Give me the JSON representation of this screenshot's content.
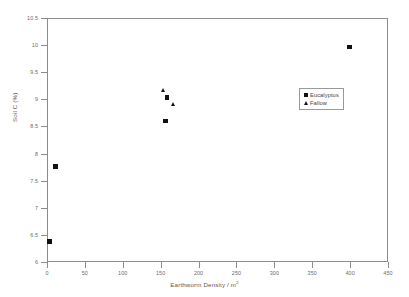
{
  "chart_data": {
    "type": "scatter",
    "title": "",
    "xlabel": "Earthworm Density / m",
    "xlabel_sup": "2",
    "ylabel": "Soil C (%)",
    "xlim": [
      0,
      450
    ],
    "ylim": [
      6,
      10.5
    ],
    "xticks": [
      0,
      50,
      100,
      150,
      200,
      250,
      300,
      350,
      400,
      450
    ],
    "xtick_labels": [
      "0",
      "50",
      "100",
      "150",
      "200",
      "250",
      "300",
      "350",
      "400",
      "450"
    ],
    "yticks": [
      6,
      6.5,
      7,
      7.5,
      8,
      8.5,
      9,
      9.5,
      10,
      10.5
    ],
    "ytick_labels": [
      "6",
      "6.5",
      "7",
      "7.5",
      "8",
      "8.5",
      "9",
      "9.5",
      "10",
      "10.5"
    ],
    "grid": false,
    "legend_position": "upper right",
    "marker_color": "#111111",
    "frame_color": "#8c8c8c",
    "series": [
      {
        "name": "Eucalyptus",
        "marker": "square",
        "points": [
          {
            "x": 2,
            "y": 6.4
          },
          {
            "x": 10,
            "y": 7.78
          },
          {
            "x": 155,
            "y": 8.62
          },
          {
            "x": 157,
            "y": 9.05
          },
          {
            "x": 398,
            "y": 9.98
          }
        ]
      },
      {
        "name": "Fallow",
        "marker": "triangle",
        "points": [
          {
            "x": 152,
            "y": 9.18
          },
          {
            "x": 166,
            "y": 8.92
          }
        ]
      }
    ]
  },
  "legend": {
    "items": [
      {
        "label": "Eucalyptus",
        "marker": "square-marker-icon"
      },
      {
        "label": "Fallow",
        "marker": "triangle-marker-icon"
      }
    ]
  }
}
